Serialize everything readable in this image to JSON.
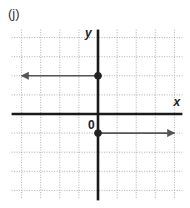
{
  "figure_label": "(j)",
  "chart_data": {
    "type": "line",
    "title": "(j)",
    "xlabel": "x",
    "ylabel": "y",
    "origin_label": "0",
    "grid": true,
    "xlim": [
      -4,
      4
    ],
    "ylim": [
      -4,
      4
    ],
    "tick_spacing": 1,
    "series": [
      {
        "name": "upper-ray",
        "description": "horizontal ray y = 2 for x <= 0, closed endpoint at (0, 2), arrow pointing left",
        "x": [
          0,
          -4
        ],
        "y": [
          2,
          2
        ],
        "endpoint": {
          "x": 0,
          "y": 2,
          "closed": true
        },
        "arrow": "left"
      },
      {
        "name": "lower-ray",
        "description": "horizontal ray y = -1 for x >= 0, closed endpoint at (0, -1), arrow pointing right",
        "x": [
          0,
          4
        ],
        "y": [
          -1,
          -1
        ],
        "endpoint": {
          "x": 0,
          "y": -1,
          "closed": true
        },
        "arrow": "right"
      }
    ]
  }
}
